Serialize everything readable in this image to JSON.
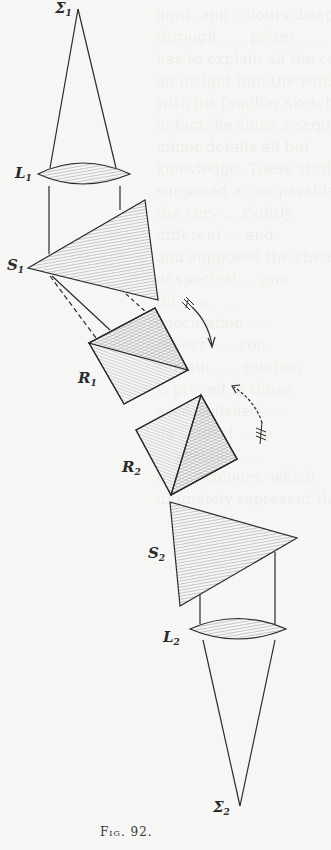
{
  "figure": {
    "caption": "Fig. 92.",
    "labels": {
      "sigma1": {
        "main": "Σ",
        "sub": "1"
      },
      "lens1": {
        "main": "L",
        "sub": "1"
      },
      "prism1": {
        "main": "S",
        "sub": "1"
      },
      "rhomb1": {
        "main": "R",
        "sub": "1"
      },
      "rhomb2": {
        "main": "R",
        "sub": "2"
      },
      "prism2": {
        "main": "S",
        "sub": "2"
      },
      "lens2": {
        "main": "L",
        "sub": "2"
      },
      "sigma2": {
        "main": "Σ",
        "sub": "2"
      }
    },
    "colors": {
      "ink": "#2b2b2b",
      "paper": "#f6f6f4",
      "hatch": "#8a8a8a"
    }
  },
  "bleed_text": {
    "lines": [
      "light, and colours disapp",
      "through . . . prism . . .",
      "has to explain all the corr",
      "an insight into the works",
      "with his familiar sketches",
      "in fact, he signs a seque",
      "minor details all but",
      "knowledge. These studies",
      "supposed a comparable",
      "the very ... rightly",
      "different ... and",
      "and supposed the chemistry",
      "of spectral ... and",
      "fill ... a . . .",
      "speculation . . .",
      "reflect . . . con",
      "certain . . . relation",
      "is proved in those",
      "accomplished . . .",
      "its central ... to",
      "... practice . . .",
      "the ... colours, which",
      "ultimately represent their"
    ]
  }
}
